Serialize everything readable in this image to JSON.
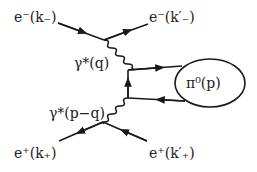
{
  "diagram": {
    "type": "feynman",
    "labels": {
      "e_minus_in": "e⁻(k₋)",
      "e_minus_out": "e⁻(k′₋)",
      "photon_top": "γ*(q)",
      "photon_bottom": "γ*(p−q)",
      "e_plus_in": "e⁺(k₊)",
      "e_plus_out": "e⁺(k′₊)",
      "pion_blob": "π⁰(p)"
    },
    "line_color": "#1a1a1a"
  }
}
